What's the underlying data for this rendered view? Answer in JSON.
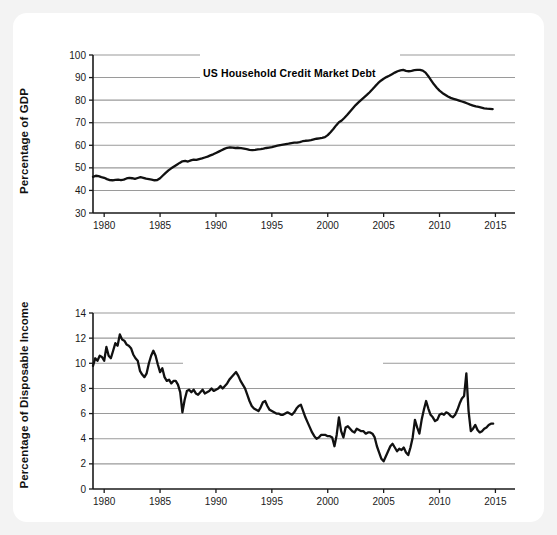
{
  "figure": {
    "name": "two-panel-time-series-figure",
    "background": "#f3f3f3",
    "card_background": "#ffffff",
    "line_color": "#111111",
    "grid_color": "#9a9a9a",
    "axis_color": "#1a1a1a"
  },
  "chart_data": [
    {
      "type": "line",
      "id": "us-household-credit-market-debt",
      "title": "US Household Credit Market Debt",
      "xlabel": "",
      "ylabel": "Percentage of GDP",
      "xlim": [
        1979,
        2015.5
      ],
      "ylim": [
        30,
        100
      ],
      "xticks": [
        1980,
        1985,
        1990,
        1995,
        2000,
        2005,
        2010,
        2015
      ],
      "yticks": [
        30,
        40,
        50,
        60,
        70,
        80,
        90,
        100
      ],
      "xtick_labels": [
        "1980",
        "1985",
        "1990",
        "1995",
        "2000",
        "2005",
        "2010",
        "2015"
      ],
      "ytick_labels": [
        "30",
        "40",
        "50",
        "60",
        "70",
        "80",
        "90",
        "100"
      ],
      "grid": true,
      "grid_axis": "y",
      "legend": "none",
      "x": [
        1979.0,
        1979.25,
        1979.5,
        1979.75,
        1980.0,
        1980.25,
        1980.5,
        1980.75,
        1981.0,
        1981.25,
        1981.5,
        1981.75,
        1982.0,
        1982.25,
        1982.5,
        1982.75,
        1983.0,
        1983.25,
        1983.5,
        1983.75,
        1984.0,
        1984.25,
        1984.5,
        1984.75,
        1985.0,
        1985.25,
        1985.5,
        1985.75,
        1986.0,
        1986.25,
        1986.5,
        1986.75,
        1987.0,
        1987.25,
        1987.5,
        1987.75,
        1988.0,
        1988.25,
        1988.5,
        1988.75,
        1989.0,
        1989.25,
        1989.5,
        1989.75,
        1990.0,
        1990.25,
        1990.5,
        1990.75,
        1991.0,
        1991.25,
        1991.5,
        1991.75,
        1992.0,
        1992.25,
        1992.5,
        1992.75,
        1993.0,
        1993.25,
        1993.5,
        1993.75,
        1994.0,
        1994.25,
        1994.5,
        1994.75,
        1995.0,
        1995.25,
        1995.5,
        1995.75,
        1996.0,
        1996.25,
        1996.5,
        1996.75,
        1997.0,
        1997.25,
        1997.5,
        1997.75,
        1998.0,
        1998.25,
        1998.5,
        1998.75,
        1999.0,
        1999.25,
        1999.5,
        1999.75,
        2000.0,
        2000.25,
        2000.5,
        2000.75,
        2001.0,
        2001.25,
        2001.5,
        2001.75,
        2002.0,
        2002.25,
        2002.5,
        2002.75,
        2003.0,
        2003.25,
        2003.5,
        2003.75,
        2004.0,
        2004.25,
        2004.5,
        2004.75,
        2005.0,
        2005.25,
        2005.5,
        2005.75,
        2006.0,
        2006.25,
        2006.5,
        2006.75,
        2007.0,
        2007.25,
        2007.5,
        2007.75,
        2008.0,
        2008.25,
        2008.5,
        2008.75,
        2009.0,
        2009.25,
        2009.5,
        2009.75,
        2010.0,
        2010.25,
        2010.5,
        2010.75,
        2011.0,
        2011.25,
        2011.5,
        2011.75,
        2012.0,
        2012.25,
        2012.5,
        2012.75,
        2013.0,
        2013.25,
        2013.5,
        2013.75,
        2014.0,
        2014.25,
        2014.5,
        2014.75,
        2015.0
      ],
      "y": [
        46.0,
        46.5,
        46.3,
        45.9,
        45.6,
        45.0,
        44.6,
        44.5,
        44.7,
        44.8,
        44.6,
        44.8,
        45.3,
        45.6,
        45.4,
        45.1,
        45.5,
        45.9,
        45.6,
        45.2,
        45.0,
        44.8,
        44.5,
        44.6,
        45.4,
        46.6,
        47.8,
        48.9,
        49.8,
        50.6,
        51.4,
        52.2,
        52.9,
        53.1,
        52.8,
        53.3,
        53.6,
        53.5,
        53.9,
        54.2,
        54.6,
        55.0,
        55.5,
        56.0,
        56.6,
        57.2,
        57.8,
        58.4,
        58.9,
        59.1,
        59.0,
        58.8,
        58.9,
        58.7,
        58.5,
        58.3,
        58.0,
        57.9,
        58.0,
        58.2,
        58.3,
        58.5,
        58.8,
        59.0,
        59.2,
        59.5,
        59.8,
        60.1,
        60.3,
        60.5,
        60.7,
        61.0,
        61.2,
        61.2,
        61.4,
        61.8,
        62.0,
        62.1,
        62.3,
        62.6,
        62.9,
        63.1,
        63.3,
        63.6,
        64.5,
        65.8,
        67.2,
        68.8,
        70.2,
        71.0,
        72.2,
        73.5,
        75.0,
        76.4,
        77.8,
        79.0,
        80.1,
        81.2,
        82.3,
        83.5,
        84.8,
        86.2,
        87.5,
        88.6,
        89.5,
        90.2,
        90.8,
        91.5,
        92.2,
        92.8,
        93.2,
        93.4,
        93.0,
        92.8,
        93.0,
        93.3,
        93.4,
        93.4,
        93.1,
        92.2,
        90.6,
        88.8,
        87.0,
        85.5,
        84.2,
        83.2,
        82.4,
        81.6,
        81.0,
        80.6,
        80.2,
        79.8,
        79.4,
        79.0,
        78.5,
        78.0,
        77.6,
        77.2,
        77.0,
        76.7,
        76.4,
        76.2,
        76.1,
        76.0
      ],
      "annotations": [
        {
          "text": "Peak ~93.4% of GDP around 2007-2008",
          "visible": false
        }
      ]
    },
    {
      "type": "line",
      "id": "us-personal-saving-rate",
      "title": "US Personal Saving Rate",
      "xlabel": "",
      "ylabel": "Percentage of Disposable Income",
      "xlim": [
        1979,
        2015.5
      ],
      "ylim": [
        0,
        14
      ],
      "xticks": [
        1980,
        1985,
        1990,
        1995,
        2000,
        2005,
        2010,
        2015
      ],
      "yticks": [
        0,
        2,
        4,
        6,
        8,
        10,
        12,
        14
      ],
      "xtick_labels": [
        "1980",
        "1985",
        "1990",
        "1995",
        "2000",
        "2005",
        "2010",
        "2015"
      ],
      "ytick_labels": [
        "0",
        "2",
        "4",
        "6",
        "8",
        "10",
        "12",
        "14"
      ],
      "grid": true,
      "grid_axis": "y",
      "legend": "none",
      "x": [
        1979.0,
        1979.2,
        1979.4,
        1979.6,
        1979.8,
        1980.0,
        1980.2,
        1980.4,
        1980.6,
        1980.8,
        1981.0,
        1981.2,
        1981.4,
        1981.6,
        1981.8,
        1982.0,
        1982.2,
        1982.4,
        1982.6,
        1982.8,
        1983.0,
        1983.2,
        1983.4,
        1983.6,
        1983.8,
        1984.0,
        1984.2,
        1984.4,
        1984.6,
        1984.8,
        1985.0,
        1985.2,
        1985.4,
        1985.6,
        1985.8,
        1986.0,
        1986.2,
        1986.4,
        1986.6,
        1986.8,
        1987.0,
        1987.2,
        1987.4,
        1987.6,
        1987.8,
        1988.0,
        1988.2,
        1988.4,
        1988.6,
        1988.8,
        1989.0,
        1989.2,
        1989.4,
        1989.6,
        1989.8,
        1990.0,
        1990.2,
        1990.4,
        1990.6,
        1990.8,
        1991.0,
        1991.2,
        1991.4,
        1991.6,
        1991.8,
        1992.0,
        1992.2,
        1992.4,
        1992.6,
        1992.8,
        1993.0,
        1993.2,
        1993.4,
        1993.6,
        1993.8,
        1994.0,
        1994.2,
        1994.4,
        1994.6,
        1994.8,
        1995.0,
        1995.2,
        1995.4,
        1995.6,
        1995.8,
        1996.0,
        1996.2,
        1996.4,
        1996.6,
        1996.8,
        1997.0,
        1997.2,
        1997.4,
        1997.6,
        1997.8,
        1998.0,
        1998.2,
        1998.4,
        1998.6,
        1998.8,
        1999.0,
        1999.2,
        1999.4,
        1999.6,
        1999.8,
        2000.0,
        2000.2,
        2000.4,
        2000.6,
        2000.8,
        2001.0,
        2001.2,
        2001.4,
        2001.6,
        2001.8,
        2002.0,
        2002.2,
        2002.4,
        2002.6,
        2002.8,
        2003.0,
        2003.2,
        2003.4,
        2003.6,
        2003.8,
        2004.0,
        2004.2,
        2004.4,
        2004.6,
        2004.8,
        2005.0,
        2005.2,
        2005.4,
        2005.6,
        2005.8,
        2006.0,
        2006.2,
        2006.4,
        2006.6,
        2006.8,
        2007.0,
        2007.2,
        2007.4,
        2007.6,
        2007.8,
        2008.0,
        2008.2,
        2008.4,
        2008.6,
        2008.8,
        2009.0,
        2009.2,
        2009.4,
        2009.6,
        2009.8,
        2010.0,
        2010.2,
        2010.4,
        2010.6,
        2010.8,
        2011.0,
        2011.2,
        2011.4,
        2011.6,
        2011.8,
        2012.0,
        2012.2,
        2012.4,
        2012.6,
        2012.8,
        2013.0,
        2013.2,
        2013.4,
        2013.6,
        2013.8,
        2014.0,
        2014.2,
        2014.4,
        2014.6,
        2014.8,
        2015.0
      ],
      "y": [
        9.8,
        10.4,
        10.2,
        10.6,
        10.5,
        10.2,
        11.3,
        10.6,
        10.4,
        11.0,
        11.6,
        11.4,
        12.3,
        11.9,
        11.8,
        11.5,
        11.4,
        11.2,
        10.7,
        10.4,
        10.2,
        9.4,
        9.1,
        8.9,
        9.2,
        10.0,
        10.6,
        11.0,
        10.6,
        9.9,
        9.3,
        9.6,
        8.9,
        8.6,
        8.7,
        8.4,
        8.6,
        8.6,
        8.3,
        7.7,
        6.1,
        7.1,
        7.8,
        7.9,
        7.7,
        7.9,
        7.6,
        7.5,
        7.7,
        7.9,
        7.6,
        7.7,
        7.8,
        8.0,
        7.8,
        7.9,
        8.0,
        8.2,
        8.0,
        8.2,
        8.4,
        8.7,
        8.9,
        9.1,
        9.3,
        9.0,
        8.6,
        8.3,
        8.0,
        7.5,
        7.0,
        6.6,
        6.4,
        6.3,
        6.2,
        6.5,
        6.9,
        7.0,
        6.6,
        6.3,
        6.2,
        6.1,
        6.0,
        6.0,
        5.9,
        5.9,
        6.0,
        6.1,
        6.0,
        5.9,
        6.1,
        6.4,
        6.6,
        6.7,
        6.2,
        5.7,
        5.3,
        4.9,
        4.5,
        4.2,
        4.0,
        4.1,
        4.3,
        4.3,
        4.3,
        4.2,
        4.2,
        4.1,
        3.4,
        4.3,
        5.7,
        4.6,
        4.1,
        4.9,
        5.0,
        4.8,
        4.6,
        4.5,
        4.8,
        4.7,
        4.6,
        4.6,
        4.4,
        4.5,
        4.5,
        4.4,
        4.1,
        3.4,
        2.9,
        2.4,
        2.2,
        2.6,
        3.0,
        3.4,
        3.6,
        3.3,
        3.0,
        3.2,
        3.1,
        3.3,
        2.9,
        2.7,
        3.3,
        4.1,
        5.5,
        4.9,
        4.4,
        5.5,
        6.3,
        7.0,
        6.4,
        5.9,
        5.7,
        5.4,
        5.5,
        5.9,
        6.0,
        5.9,
        6.1,
        6.0,
        5.8,
        5.7,
        5.9,
        6.3,
        6.8,
        7.2,
        7.4,
        9.2,
        6.2,
        4.6,
        4.8,
        5.1,
        4.7,
        4.5,
        4.6,
        4.8,
        4.9,
        5.1,
        5.2,
        5.2
      ],
      "annotations": [
        {
          "text": "Spike to about 9.2% in late 2012",
          "visible": false
        }
      ]
    }
  ]
}
